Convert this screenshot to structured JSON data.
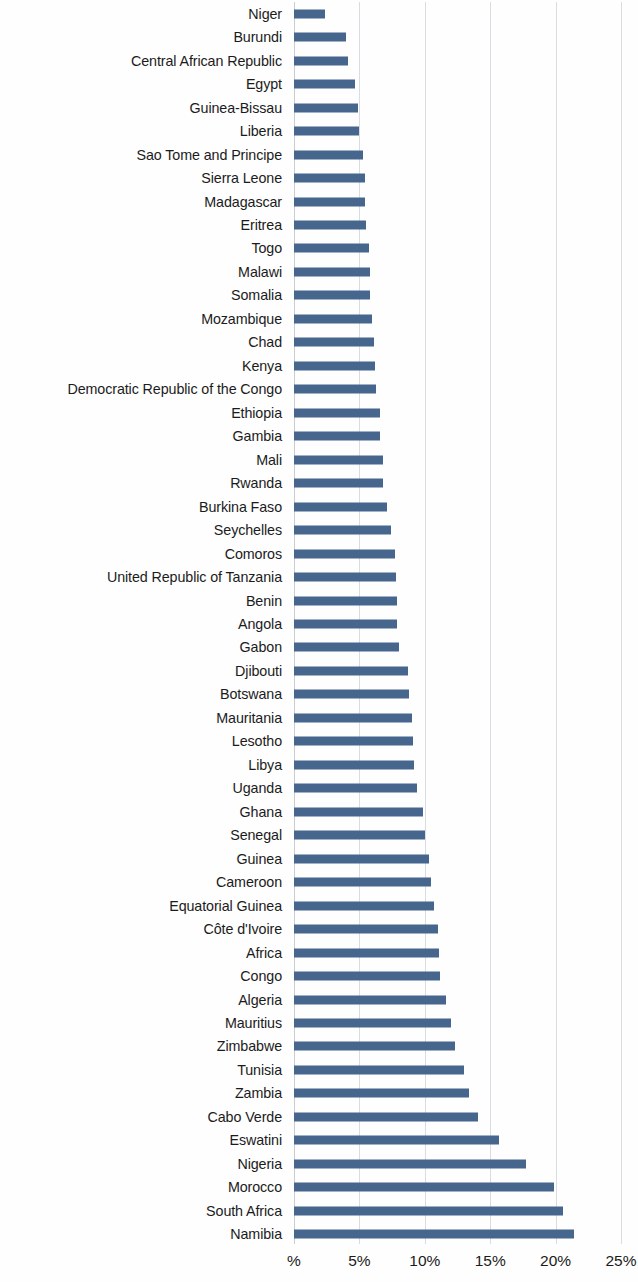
{
  "chart_data": {
    "type": "bar",
    "orientation": "horizontal",
    "title": "",
    "subtitle": "",
    "xlabel": "",
    "ylabel": "",
    "xlim": [
      0,
      25
    ],
    "xtick_labels": [
      "%",
      "5%",
      "10%",
      "15%",
      "20%",
      "25%"
    ],
    "xtick_values": [
      0,
      5,
      10,
      15,
      20,
      25
    ],
    "grid": true,
    "legend": null,
    "value_unit": "%",
    "bar_color": "#46668e",
    "gridline_color": "#d9dde2",
    "text_color": "#1b1b1b",
    "background_color": "#ffffff",
    "categories": [
      "Niger",
      "Burundi",
      "Central African Republic",
      "Egypt",
      "Guinea-Bissau",
      "Liberia",
      "Sao Tome and Principe",
      "Sierra Leone",
      "Madagascar",
      "Eritrea",
      "Togo",
      "Malawi",
      "Somalia",
      "Mozambique",
      "Chad",
      "Kenya",
      "Democratic Republic of the Congo",
      "Ethiopia",
      "Gambia",
      "Mali",
      "Rwanda",
      "Burkina Faso",
      "Seychelles",
      "Comoros",
      "United Republic of Tanzania",
      "Benin",
      "Angola",
      "Gabon",
      "Djibouti",
      "Botswana",
      "Mauritania",
      "Lesotho",
      "Libya",
      "Uganda",
      "Ghana",
      "Senegal",
      "Guinea",
      "Cameroon",
      "Equatorial Guinea",
      "Côte d'Ivoire",
      "Africa",
      "Congo",
      "Algeria",
      "Mauritius",
      "Zimbabwe",
      "Tunisia",
      "Zambia",
      "Cabo Verde",
      "Eswatini",
      "Nigeria",
      "Morocco",
      "South Africa",
      "Namibia"
    ],
    "values": [
      2.4,
      4.0,
      4.1,
      4.7,
      4.9,
      5.0,
      5.3,
      5.4,
      5.4,
      5.5,
      5.7,
      5.8,
      5.8,
      6.0,
      6.1,
      6.2,
      6.3,
      6.6,
      6.6,
      6.8,
      6.8,
      7.1,
      7.4,
      7.7,
      7.8,
      7.9,
      7.9,
      8.0,
      8.7,
      8.8,
      9.0,
      9.1,
      9.2,
      9.4,
      9.9,
      10.0,
      10.3,
      10.5,
      10.7,
      11.0,
      11.1,
      11.2,
      11.6,
      12.0,
      12.3,
      13.0,
      13.4,
      14.1,
      15.7,
      17.7,
      19.9,
      20.6,
      21.4
    ]
  }
}
